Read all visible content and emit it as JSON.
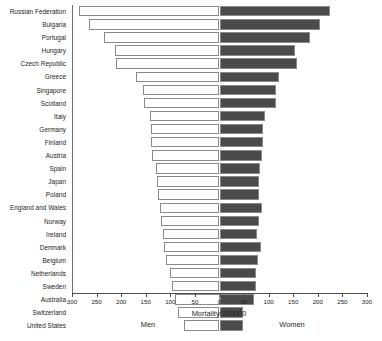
{
  "chart_data": {
    "type": "bar",
    "subtype": "diverging-population-pyramid",
    "title": "",
    "xlabel": "Mortality/100000",
    "ylabel": "",
    "left_group_label": "Men",
    "right_group_label": "Women",
    "grid": false,
    "legend": "none",
    "xlim": [
      -300,
      300
    ],
    "xticks": [
      300,
      250,
      200,
      150,
      100,
      50,
      0,
      50,
      100,
      150,
      200,
      250,
      300
    ],
    "xtick_labels": [
      "300",
      "250",
      "200",
      "150",
      "100",
      "50",
      "0",
      "50",
      "100",
      "150",
      "200",
      "250",
      "300"
    ],
    "categories": [
      "Russian Federation",
      "Bulgaria",
      "Portugal",
      "Hungary",
      "Czech Republic",
      "Greece",
      "Singapore",
      "Scotland",
      "Italy",
      "Germany",
      "Finland",
      "Austria",
      "Spain",
      "Japan",
      "Poland",
      "England and Wales",
      "Norway",
      "Ireland",
      "Denmark",
      "Belgium",
      "Netherlands",
      "Sweden",
      "Australia",
      "Switzerland",
      "United States"
    ],
    "series": [
      {
        "name": "Men",
        "direction": "left",
        "color": "#ffffff",
        "values": [
          286,
          265,
          235,
          212,
          211,
          169,
          156,
          153,
          141,
          139,
          139,
          138,
          130,
          127,
          126,
          122,
          118,
          115,
          112,
          108,
          100,
          96,
          90,
          84,
          72
        ]
      },
      {
        "name": "Women",
        "direction": "right",
        "color": "#4a4a4a",
        "values": [
          225,
          205,
          185,
          153,
          157,
          122,
          114,
          114,
          92,
          88,
          88,
          87,
          82,
          80,
          80,
          87,
          80,
          77,
          84,
          78,
          74,
          74,
          70,
          48,
          48
        ]
      }
    ]
  },
  "axis": {
    "x_title": "Mortality/100000",
    "left_label": "Men",
    "right_label": "Women"
  }
}
